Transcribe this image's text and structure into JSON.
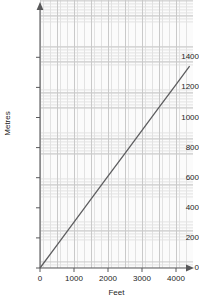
{
  "chart_data": {
    "type": "line",
    "title": "",
    "xlabel": "Feet",
    "ylabel": "Metres",
    "xlim": [
      0,
      4500
    ],
    "ylim": [
      0,
      1450
    ],
    "xticks": [
      0,
      1000,
      2000,
      3000,
      4000
    ],
    "xtick_labels": [
      "0",
      "1000",
      "2000",
      "3000",
      "4000"
    ],
    "yticks": [
      0,
      200,
      400,
      600,
      800,
      1000,
      1200,
      1400
    ],
    "ytick_labels": [
      "0",
      "200",
      "400",
      "600",
      "800",
      "1000",
      "1200",
      "1400"
    ],
    "grid": "graph-paper minor and major grid",
    "legend": "none",
    "series": [
      {
        "name": "Feet to Metres conversion",
        "x": [
          0,
          500,
          1000,
          1500,
          2000,
          2500,
          3000,
          3500,
          4000,
          4400
        ],
        "values": [
          0,
          152,
          305,
          457,
          610,
          762,
          914,
          1067,
          1219,
          1341
        ]
      }
    ],
    "line_color": "#5e5e60",
    "grid_color": "#c9c9c9",
    "axis_color": "#58585a",
    "plot_background": "#fbfbfb"
  },
  "axes": {
    "y_title": "Metres",
    "x_title": "Feet"
  }
}
